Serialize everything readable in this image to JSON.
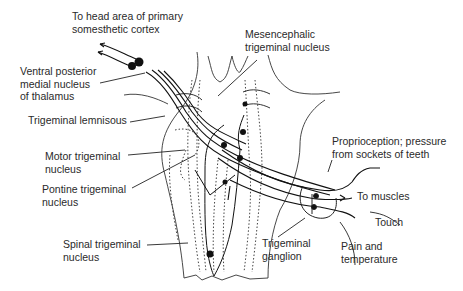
{
  "diagram": {
    "type": "anatomical-pathway",
    "labels": {
      "cortex": [
        "To head area of primary",
        "somesthetic cortex"
      ],
      "vpm": [
        "Ventral posterior",
        "medial nucleus",
        "of thalamus"
      ],
      "lemniscus": [
        "Trigeminal lemnisous"
      ],
      "motor": [
        "Motor trigeminal",
        "nucleus"
      ],
      "pontine": [
        "Pontine trigeminal",
        "nucleus"
      ],
      "spinal": [
        "Spinal trigeminal",
        "nucleus"
      ],
      "mesencephalic": [
        "Mesencephalic",
        "trigeminal nucleus"
      ],
      "proprioception": [
        "Proprioception; pressure",
        "from sockets of teeth"
      ],
      "muscles": [
        "To muscles"
      ],
      "touch": [
        "Touch"
      ],
      "pain": [
        "Pain and",
        "temperature"
      ],
      "ganglion": [
        "Trigeminal",
        "ganglion"
      ]
    },
    "colors": {
      "line": "#222222",
      "background": "#ffffff"
    }
  }
}
